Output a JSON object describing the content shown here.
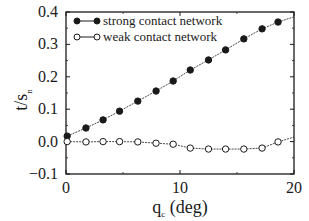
{
  "chart_data": {
    "type": "line",
    "title": "",
    "xlabel": "q_c (deg)",
    "xlabel_main": "q",
    "xlabel_sub": "c",
    "xlabel_suffix": " (deg)",
    "ylabel": "t/s_n",
    "ylabel_main": "t/s",
    "ylabel_sub": "n",
    "xlim": [
      0,
      20
    ],
    "ylim": [
      -0.1,
      0.4
    ],
    "xticks": [
      0,
      10,
      20
    ],
    "xtick_labels": [
      "0",
      "10",
      "20"
    ],
    "yticks": [
      -0.1,
      0.0,
      0.1,
      0.2,
      0.3,
      0.4
    ],
    "ytick_labels": [
      "−0.1",
      "0.0",
      "0.1",
      "0.2",
      "0.3",
      "0.4"
    ],
    "grid": false,
    "legend_position": "upper left",
    "series": [
      {
        "name": "strong contact network",
        "marker": "filled-circle",
        "x": [
          0.1,
          1.75,
          3.25,
          4.7,
          6.3,
          7.9,
          9.4,
          10.9,
          12.5,
          14.0,
          15.6,
          17.2,
          18.6
        ],
        "values": [
          0.017,
          0.042,
          0.067,
          0.094,
          0.125,
          0.156,
          0.187,
          0.221,
          0.252,
          0.283,
          0.317,
          0.348,
          0.369
        ],
        "line_end": [
          20,
          0.385
        ]
      },
      {
        "name": "weak contact network",
        "marker": "open-circle",
        "x": [
          0.1,
          1.75,
          3.25,
          4.7,
          6.3,
          7.9,
          9.4,
          10.9,
          12.5,
          14.0,
          15.6,
          17.2,
          18.6
        ],
        "values": [
          0.0,
          -0.001,
          0.0,
          0.0,
          -0.001,
          -0.005,
          -0.008,
          -0.02,
          -0.023,
          -0.023,
          -0.023,
          -0.02,
          -0.001
        ],
        "line_end": [
          20,
          0.014
        ]
      }
    ]
  },
  "colors": {
    "ink": "#1a1a1a",
    "background": "#ffffff"
  }
}
